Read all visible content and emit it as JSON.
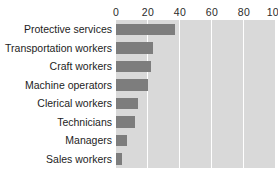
{
  "chart_data": {
    "type": "bar",
    "orientation": "horizontal",
    "title": "",
    "subtitle": "",
    "xlabel": "",
    "ylabel": "",
    "categories": [
      "Protective services",
      "Transportation workers",
      "Craft workers",
      "Machine operators",
      "Clerical workers",
      "Technicians",
      "Managers",
      "Sales workers"
    ],
    "values": [
      37,
      23,
      22,
      20,
      14,
      12,
      7,
      4
    ],
    "xlim": [
      0,
      100
    ],
    "xticks": [
      0,
      20,
      40,
      60,
      80,
      100
    ],
    "xtick_labels": [
      "0",
      "20",
      "40",
      "60",
      "80",
      "100"
    ],
    "grid": true,
    "grid_axis": "x",
    "legend": false,
    "legend_position": "none",
    "colors": {
      "bar": "#7d7d7d",
      "plot_background": "#d9d9d9",
      "gridline": "#ffffff",
      "page_background": "#ffffff",
      "label_text": "#1d1d1d",
      "tick_text": "#2b2b2b"
    }
  }
}
